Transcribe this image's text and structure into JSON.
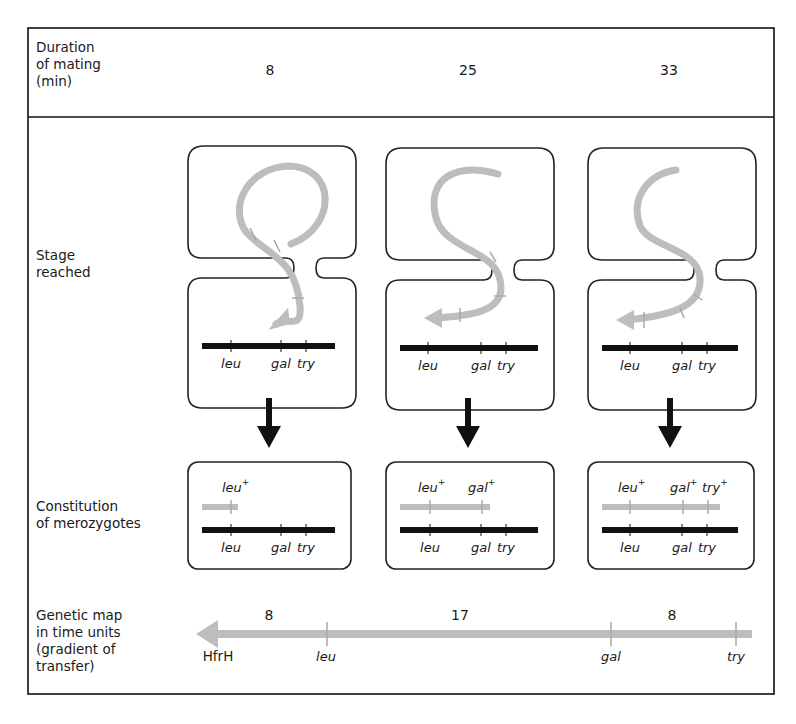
{
  "rows": {
    "duration": {
      "label_lines": [
        "Duration",
        "of mating",
        "(min)"
      ]
    },
    "stage": {
      "label_lines": [
        "Stage",
        "reached"
      ]
    },
    "constitution": {
      "label_lines": [
        "Constitution",
        "of merozygotes"
      ]
    },
    "map": {
      "label_lines": [
        "Genetic map",
        "in time units",
        "(gradient of",
        "transfer)"
      ]
    }
  },
  "columns": [
    {
      "duration_min": "8",
      "transferred": [
        "leu+"
      ]
    },
    {
      "duration_min": "25",
      "transferred": [
        "leu+",
        "gal+"
      ]
    },
    {
      "duration_min": "33",
      "transferred": [
        "leu+",
        "gal+",
        "try+"
      ]
    }
  ],
  "recipient_genes": [
    "leu",
    "gal",
    "try"
  ],
  "donor_gene_labels": {
    "leu": "leu",
    "gal": "gal",
    "try": "try",
    "plus": "+"
  },
  "genetic_map": {
    "origin": "HfrH",
    "markers": [
      "leu",
      "gal",
      "try"
    ],
    "intervals": [
      "8",
      "17",
      "8"
    ]
  },
  "colors": {
    "donor_dna": "#bdbdbd",
    "chromosome": "#111111",
    "border": "#222222"
  }
}
